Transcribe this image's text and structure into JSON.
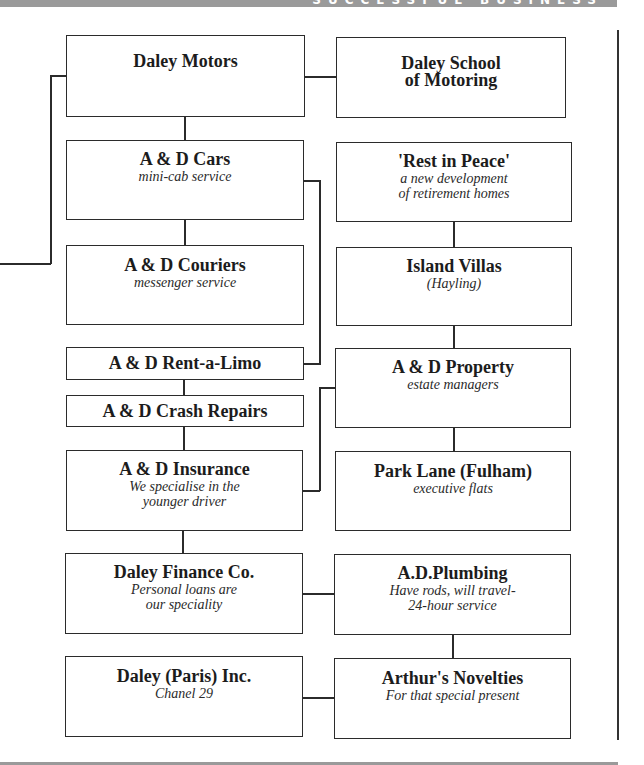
{
  "header": {
    "partial_title": "SUCCESSFUL BUSINESS",
    "bar_color": "#9a9a9a"
  },
  "chart": {
    "left_column": [
      {
        "title": "Daley Motors",
        "subtitle": ""
      },
      {
        "title": "A & D Cars",
        "subtitle": "mini-cab service"
      },
      {
        "title": "A & D Couriers",
        "subtitle": "messenger service"
      },
      {
        "title": "A & D Rent-a-Limo",
        "subtitle": ""
      },
      {
        "title": "A & D Crash Repairs",
        "subtitle": ""
      },
      {
        "title": "A & D Insurance",
        "subtitle": "We specialise in the\nyounger driver"
      },
      {
        "title": "Daley Finance Co.",
        "subtitle": "Personal loans are\nour speciality"
      },
      {
        "title": "Daley (Paris) Inc.",
        "subtitle": "Chanel 29"
      }
    ],
    "right_column": [
      {
        "title": "Daley School\nof Motoring",
        "subtitle": ""
      },
      {
        "title": "'Rest in Peace'",
        "subtitle": "a new development\nof retirement homes"
      },
      {
        "title": "Island Villas",
        "subtitle": "(Hayling)"
      },
      {
        "title": "A & D Property",
        "subtitle": "estate managers"
      },
      {
        "title": "Park Lane (Fulham)",
        "subtitle": "executive flats"
      },
      {
        "title": "A.D.Plumbing",
        "subtitle": "Have rods, will travel-\n24-hour service"
      },
      {
        "title": "Arthur's Novelties",
        "subtitle": "For that special present"
      }
    ]
  }
}
